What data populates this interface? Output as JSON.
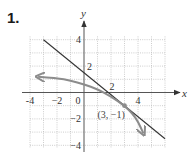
{
  "problem": {
    "number": "1."
  },
  "chart_data": {
    "type": "line",
    "title": "",
    "xlabel": "x",
    "ylabel": "y",
    "xlim": [
      -4,
      6
    ],
    "ylim": [
      -4,
      4
    ],
    "grid": true,
    "x_tick_labels": [
      {
        "value": -4,
        "label": "-4"
      },
      {
        "value": -2,
        "label": "−2"
      },
      {
        "value": 0,
        "label": "0"
      },
      {
        "value": 2,
        "label": "2"
      },
      {
        "value": 4,
        "label": "4"
      }
    ],
    "y_tick_labels": [
      {
        "value": 4,
        "label": "4"
      },
      {
        "value": 2,
        "label": "2"
      },
      {
        "value": -2,
        "label": "−2"
      },
      {
        "value": -4,
        "label": "−4"
      }
    ],
    "series": [
      {
        "name": "tangent line",
        "style": "solid",
        "color": "#333333",
        "equation": "y = -5/6 x + 3/2",
        "x": [
          -3,
          6
        ],
        "y": [
          4,
          -3.5
        ]
      },
      {
        "name": "curve",
        "style": "arrows-both-ends",
        "color": "#8c8c8c",
        "x": [
          -3.4,
          -2,
          -1,
          0,
          1,
          2,
          3,
          3.6,
          4.0,
          4.4
        ],
        "y": [
          1.2,
          1.1,
          0.9,
          0.62,
          0.25,
          -0.3,
          -1.0,
          -1.6,
          -2.2,
          -3.1
        ]
      }
    ],
    "annotations": [
      {
        "text": "(3, −1)",
        "x": 3,
        "y": -1,
        "marker": "dot"
      }
    ]
  }
}
